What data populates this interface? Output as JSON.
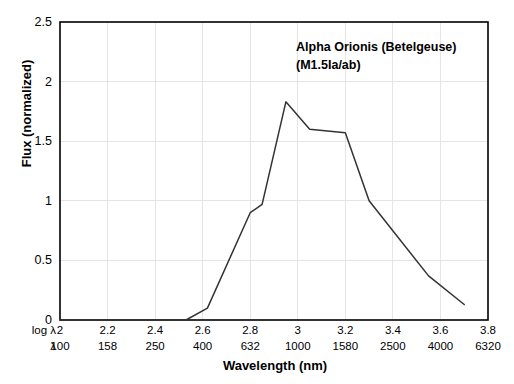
{
  "chart_data": {
    "type": "line",
    "title": "",
    "annotation": [
      "Alpha Orionis (Betelgeuse)",
      "(M1.5Ia/ab)"
    ],
    "xlabel": "Wavelength (nm)",
    "ylabel": "Flux (normalized)",
    "xlim": [
      2,
      3.8
    ],
    "ylim": [
      0,
      2.5
    ],
    "grid": true,
    "legend_position": "none",
    "x_axis_rows": [
      {
        "key": "log λ",
        "ticks": [
          "2",
          "2.2",
          "2.4",
          "2.6",
          "2.8",
          "3",
          "3.2",
          "3.4",
          "3.6",
          "3.8"
        ]
      },
      {
        "key": "λ",
        "ticks": [
          "100",
          "158",
          "250",
          "400",
          "632",
          "1000",
          "1580",
          "2500",
          "4000",
          "6320"
        ]
      }
    ],
    "y_ticks": [
      "0",
      "0.5",
      "1",
      "1.5",
      "2",
      "2.5"
    ],
    "series": [
      {
        "name": "Alpha Orionis (Betelgeuse) M1.5Ia/ab",
        "color": "#333333",
        "x": [
          2.0,
          2.53,
          2.62,
          2.8,
          2.85,
          2.95,
          3.05,
          3.2,
          3.3,
          3.55,
          3.7
        ],
        "y": [
          0.0,
          0.0,
          0.1,
          0.9,
          0.97,
          1.83,
          1.6,
          1.57,
          1.0,
          0.37,
          0.13
        ]
      }
    ]
  }
}
